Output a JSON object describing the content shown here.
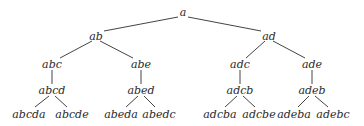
{
  "diagram": {
    "type": "tree",
    "edge_color": "#444444",
    "text_color": "#2a2a2a",
    "nodes": [
      {
        "id": "a",
        "label": "a",
        "x": 183,
        "y": 12
      },
      {
        "id": "ab",
        "label": "ab",
        "x": 96,
        "y": 36
      },
      {
        "id": "ad",
        "label": "ad",
        "x": 269,
        "y": 36
      },
      {
        "id": "abc",
        "label": "abc",
        "x": 52,
        "y": 64
      },
      {
        "id": "abe",
        "label": "abe",
        "x": 141,
        "y": 64
      },
      {
        "id": "adc",
        "label": "adc",
        "x": 240,
        "y": 64
      },
      {
        "id": "ade",
        "label": "ade",
        "x": 312,
        "y": 64
      },
      {
        "id": "abcd",
        "label": "abcd",
        "x": 52,
        "y": 90
      },
      {
        "id": "abed",
        "label": "abed",
        "x": 141,
        "y": 90
      },
      {
        "id": "adcb",
        "label": "adcb",
        "x": 240,
        "y": 90
      },
      {
        "id": "adeb",
        "label": "adeb",
        "x": 312,
        "y": 90
      },
      {
        "id": "abcda",
        "label": "abcda",
        "x": 29,
        "y": 114
      },
      {
        "id": "abcde",
        "label": "abcde",
        "x": 72,
        "y": 114
      },
      {
        "id": "abeda",
        "label": "abeda",
        "x": 121,
        "y": 114
      },
      {
        "id": "abedc",
        "label": "abedc",
        "x": 159,
        "y": 114
      },
      {
        "id": "adcba",
        "label": "adcba",
        "x": 220,
        "y": 114
      },
      {
        "id": "adcbe",
        "label": "adcbe",
        "x": 259,
        "y": 114
      },
      {
        "id": "adeba",
        "label": "adeba",
        "x": 294,
        "y": 114
      },
      {
        "id": "adebc",
        "label": "adebc",
        "x": 333,
        "y": 114
      }
    ],
    "edges": [
      {
        "from": "a",
        "to": "ab",
        "x1": 178,
        "y1": 17,
        "x2": 104,
        "y2": 31
      },
      {
        "from": "a",
        "to": "ad",
        "x1": 188,
        "y1": 17,
        "x2": 261,
        "y2": 31
      },
      {
        "from": "ab",
        "to": "abc",
        "x1": 92,
        "y1": 41,
        "x2": 60,
        "y2": 58
      },
      {
        "from": "ab",
        "to": "abe",
        "x1": 100,
        "y1": 41,
        "x2": 133,
        "y2": 58
      },
      {
        "from": "ad",
        "to": "adc",
        "x1": 265,
        "y1": 41,
        "x2": 246,
        "y2": 58
      },
      {
        "from": "ad",
        "to": "ade",
        "x1": 273,
        "y1": 41,
        "x2": 305,
        "y2": 58
      },
      {
        "from": "abc",
        "to": "abcd",
        "x1": 52,
        "y1": 70,
        "x2": 52,
        "y2": 84
      },
      {
        "from": "abe",
        "to": "abed",
        "x1": 141,
        "y1": 70,
        "x2": 141,
        "y2": 84
      },
      {
        "from": "adc",
        "to": "adcb",
        "x1": 240,
        "y1": 70,
        "x2": 240,
        "y2": 84
      },
      {
        "from": "ade",
        "to": "adeb",
        "x1": 312,
        "y1": 70,
        "x2": 312,
        "y2": 84
      },
      {
        "from": "abcd",
        "to": "abcda",
        "x1": 49,
        "y1": 96,
        "x2": 35,
        "y2": 107
      },
      {
        "from": "abcd",
        "to": "abcde",
        "x1": 55,
        "y1": 96,
        "x2": 67,
        "y2": 107
      },
      {
        "from": "abed",
        "to": "abeda",
        "x1": 138,
        "y1": 96,
        "x2": 126,
        "y2": 107
      },
      {
        "from": "abed",
        "to": "abedc",
        "x1": 144,
        "y1": 96,
        "x2": 155,
        "y2": 107
      },
      {
        "from": "adcb",
        "to": "adcba",
        "x1": 237,
        "y1": 96,
        "x2": 225,
        "y2": 107
      },
      {
        "from": "adcb",
        "to": "adcbe",
        "x1": 243,
        "y1": 96,
        "x2": 255,
        "y2": 107
      },
      {
        "from": "adeb",
        "to": "adeba",
        "x1": 309,
        "y1": 96,
        "x2": 298,
        "y2": 107
      },
      {
        "from": "adeb",
        "to": "adebc",
        "x1": 315,
        "y1": 96,
        "x2": 328,
        "y2": 107
      }
    ]
  }
}
